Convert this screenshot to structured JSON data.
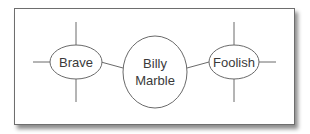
{
  "diagram": {
    "type": "spider-diagram",
    "center": {
      "lines": [
        "Billy",
        "Marble"
      ]
    },
    "nodes": [
      {
        "id": "left",
        "label": "Brave"
      },
      {
        "id": "right",
        "label": "Foolish"
      }
    ]
  }
}
